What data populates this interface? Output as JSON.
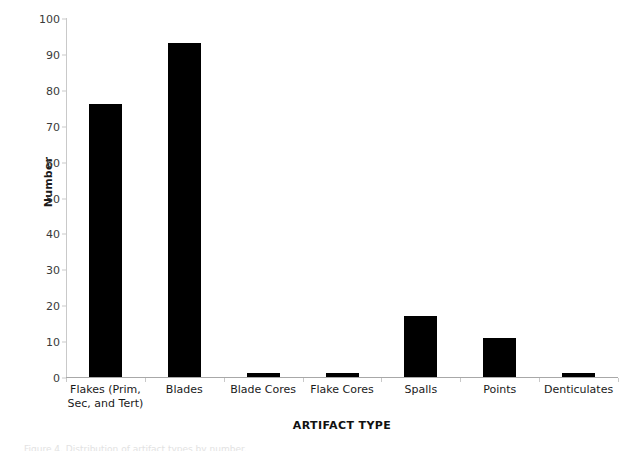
{
  "chart_data": {
    "type": "bar",
    "title": "",
    "xlabel": "ARTIFACT TYPE",
    "ylabel": "Number",
    "categories": [
      "Flakes (Prim, Sec, and Tert)",
      "Blades",
      "Blade Cores",
      "Flake Cores",
      "Spalls",
      "Points",
      "Denticulates"
    ],
    "category_lines": [
      [
        "Flakes (Prim,",
        "Sec, and Tert)"
      ],
      [
        "Blades"
      ],
      [
        "Blade Cores"
      ],
      [
        "Flake Cores"
      ],
      [
        "Spalls"
      ],
      [
        "Points"
      ],
      [
        "Denticulates"
      ]
    ],
    "values": [
      76,
      93,
      1,
      1,
      17,
      11,
      1
    ],
    "ylim": [
      0,
      100
    ],
    "ytick_labels": [
      "0",
      "10",
      "20",
      "30",
      "40",
      "50",
      "60",
      "70",
      "80",
      "90",
      "100"
    ],
    "ytick_values": [
      0,
      10,
      20,
      30,
      40,
      50,
      60,
      70,
      80,
      90,
      100
    ],
    "grid": false,
    "legend": false,
    "bar_color": "#000000",
    "axis_color": "#c9c9c9",
    "text_color": "#1a1a1a"
  },
  "caption": {
    "sliver_text": "Figure 4.  Distribution of artifact types by number."
  }
}
